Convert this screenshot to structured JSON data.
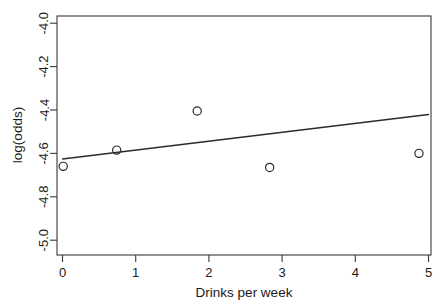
{
  "chart_data": {
    "type": "scatter",
    "title": "",
    "xlabel": "Drinks per week",
    "ylabel": "log(odds)",
    "xlim": [
      -0.25,
      5.2
    ],
    "ylim": [
      -5.05,
      -3.95
    ],
    "xticks": [
      0,
      1,
      2,
      3,
      4,
      5
    ],
    "xtick_labels": [
      "0",
      "1",
      "2",
      "3",
      "4",
      "5"
    ],
    "yticks": [
      -4.0,
      -4.2,
      -4.4,
      -4.6,
      -4.8,
      -5.0
    ],
    "ytick_labels": [
      "-4.0",
      "-4.2",
      "-4.4",
      "-4.6",
      "-4.8",
      "-5.0"
    ],
    "grid": false,
    "legend": null,
    "marker": "open-circle",
    "points": [
      {
        "x": 0.01,
        "y": -4.66
      },
      {
        "x": 0.74,
        "y": -4.585
      },
      {
        "x": 1.84,
        "y": -4.405
      },
      {
        "x": 2.83,
        "y": -4.665
      },
      {
        "x": 4.87,
        "y": -4.6
      }
    ],
    "series": [
      {
        "name": "observed",
        "type": "scatter",
        "x": [
          0.01,
          0.74,
          1.84,
          2.83,
          4.87
        ],
        "values": [
          -4.66,
          -4.585,
          -4.405,
          -4.665,
          -4.6
        ]
      },
      {
        "name": "fitted line",
        "type": "line",
        "x": [
          0.0,
          5.0
        ],
        "values": [
          -4.626,
          -4.421
        ]
      }
    ],
    "fit_line": {
      "x_start": 0.0,
      "y_start": -4.626,
      "x_end": 5.0,
      "y_end": -4.421,
      "slope": 0.041,
      "intercept": -4.626
    }
  },
  "axes": {
    "x_axis_name": "x-axis",
    "y_axis_name": "y-axis"
  }
}
